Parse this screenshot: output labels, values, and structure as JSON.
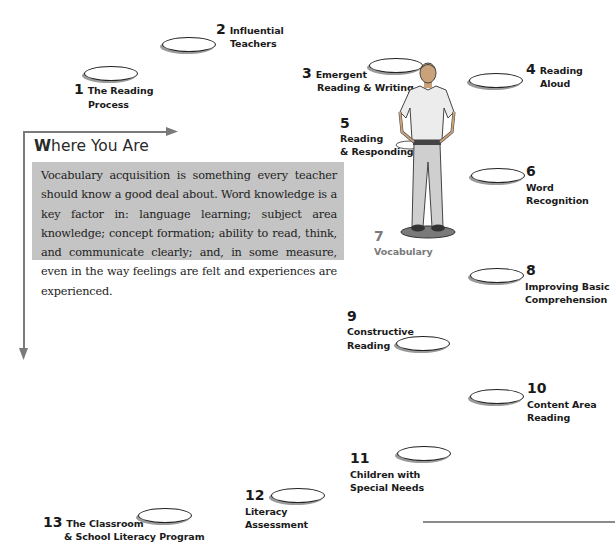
{
  "diagram": {
    "title": "Where You Are",
    "title_first_letter": "W",
    "title_rest": "here You Are",
    "description": "Vocabulary acquisition is something every teacher should know a good deal about. Word knowledge is a key factor in: language learning; subject area knowledge; concept formation; ability to read, think, and communicate clearly; and, in some measure, even in the way feelings are felt and experiences are experienced.",
    "current_chapter": 7,
    "colors": {
      "text_box_bg": "#c4c4c4",
      "active_label": "#7a7a7a",
      "label": "#1a1a1a",
      "arrow": "#7a7a7a"
    },
    "chapters": [
      {
        "number": "1",
        "label_line1": "The Reading",
        "label_line2": "Process"
      },
      {
        "number": "2",
        "label_line1": "Influential",
        "label_line2": "Teachers"
      },
      {
        "number": "3",
        "label_line1": "Emergent",
        "label_line2": "Reading & Writing"
      },
      {
        "number": "4",
        "label_line1": "Reading",
        "label_line2": "Aloud"
      },
      {
        "number": "5",
        "label_line1": "Reading",
        "label_line2": "& Responding"
      },
      {
        "number": "6",
        "label_line1": "Word",
        "label_line2": "Recognition"
      },
      {
        "number": "7",
        "label_line1": "Vocabulary",
        "label_line2": ""
      },
      {
        "number": "8",
        "label_line1": "Improving Basic",
        "label_line2": "Comprehension"
      },
      {
        "number": "9",
        "label_line1": "Constructive",
        "label_line2": "Reading"
      },
      {
        "number": "10",
        "label_line1": "Content Area",
        "label_line2": "Reading"
      },
      {
        "number": "11",
        "label_line1": "Children with",
        "label_line2": "Special Needs"
      },
      {
        "number": "12",
        "label_line1": "Literacy",
        "label_line2": "Assessment"
      },
      {
        "number": "13",
        "label_line1": "The Classroom",
        "label_line2": "& School Literacy Program"
      }
    ]
  }
}
